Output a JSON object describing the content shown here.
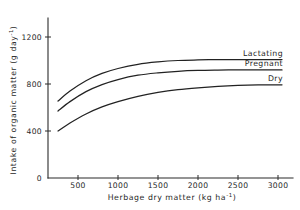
{
  "chart_data": {
    "type": "line",
    "title": "",
    "xlabel": "Herbage dry matter  (kg ha⁻¹)",
    "ylabel": "Intake of organic matter (g day⁻¹)",
    "xlabel_main": "Herbage dry matter",
    "xlabel_units": "(kg ha",
    "xlabel_units_sup": "-1",
    "xlabel_units_close": ")",
    "ylabel_main": "Intake of organic matter (g day",
    "ylabel_sup": "-1",
    "ylabel_close": ")",
    "xlim": [
      0,
      3250
    ],
    "ylim": [
      0,
      1320
    ],
    "grid": false,
    "legend_position": "inline-right-end-of-curve",
    "xticks": [
      500,
      1000,
      1500,
      2000,
      2500,
      3000
    ],
    "xtick_labels": [
      "500",
      "1000",
      "1500",
      "2000",
      "2500",
      "3000"
    ],
    "yticks": [
      0,
      400,
      800,
      1200
    ],
    "ytick_labels": [
      "0",
      "400",
      "800",
      "1200"
    ],
    "series": [
      {
        "name": "Lactating",
        "label": "Lactating",
        "x": [
          250,
          400,
          600,
          800,
          1000,
          1250,
          1500,
          1750,
          2000,
          2250,
          2500,
          2750,
          3050
        ],
        "values": [
          655,
          740,
          828,
          890,
          932,
          968,
          988,
          1000,
          1005,
          1008,
          1008,
          1008,
          1008
        ]
      },
      {
        "name": "Pregnant",
        "label": "Pregnant",
        "x": [
          250,
          400,
          600,
          800,
          1000,
          1250,
          1500,
          1750,
          2000,
          2250,
          2500,
          2750,
          3050
        ],
        "values": [
          570,
          650,
          735,
          795,
          838,
          875,
          895,
          908,
          915,
          918,
          920,
          920,
          920
        ]
      },
      {
        "name": "Dry",
        "label": "Dry",
        "x": [
          250,
          400,
          600,
          800,
          1000,
          1250,
          1500,
          1750,
          2000,
          2250,
          2500,
          2750,
          3050
        ],
        "values": [
          400,
          468,
          545,
          605,
          650,
          695,
          728,
          752,
          768,
          780,
          788,
          792,
          793
        ]
      }
    ],
    "colors": {
      "axis": "#2b2b2b",
      "curve": "#222222",
      "background": "#ffffff"
    }
  }
}
